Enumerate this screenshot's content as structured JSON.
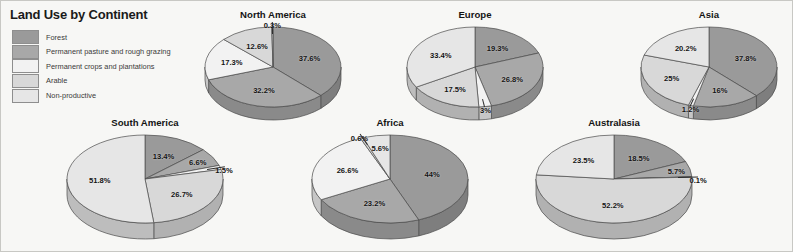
{
  "title": "Land Use by Continent",
  "legend": {
    "position": "top-left",
    "items": [
      {
        "label": "Forest",
        "color": "#9a9a9a"
      },
      {
        "label": "Permanent pasture and rough grazing",
        "color": "#a8a8a8"
      },
      {
        "label": "Permanent crops and plantations",
        "color": "#f2f2f2"
      },
      {
        "label": "Arable",
        "color": "#d8d8d8"
      },
      {
        "label": "Non-productive",
        "color": "#e6e6e6"
      }
    ]
  },
  "chart_data": {
    "type": "pie",
    "title": "Land Use by Continent",
    "xlabel": "",
    "ylabel": "",
    "units": "percent",
    "grid": false,
    "legend_position": "top-left",
    "categories": [
      "Forest",
      "Permanent pasture and rough grazing",
      "Permanent crops and plantations",
      "Arable",
      "Non-productive"
    ],
    "colors": [
      "#9a9a9a",
      "#a8a8a8",
      "#f2f2f2",
      "#d8d8d8",
      "#e6e6e6"
    ],
    "charts": [
      {
        "name": "north-america",
        "title": "North America",
        "values": [
          37.6,
          32.2,
          17.3,
          12.6,
          0.3
        ],
        "labels": [
          "37.6%",
          "32.2%",
          "17.3%",
          "12.6%",
          "0.3%"
        ]
      },
      {
        "name": "europe",
        "title": "Europe",
        "values": [
          19.3,
          26.8,
          3,
          17.5,
          33.4
        ],
        "labels": [
          "19.3%",
          "26.8%",
          "3%",
          "17.5%",
          "33.4%"
        ]
      },
      {
        "name": "asia",
        "title": "Asia",
        "values": [
          37.8,
          16,
          1.2,
          25,
          20.2
        ],
        "labels": [
          "37.8%",
          "16%",
          "1.2%",
          "25%",
          "20.2%"
        ]
      },
      {
        "name": "south-america",
        "title": "South America",
        "values": [
          13.4,
          6.6,
          1.5,
          26.7,
          51.8
        ],
        "labels": [
          "13.4%",
          "6.6%",
          "1.5%",
          "26.7%",
          "51.8%"
        ]
      },
      {
        "name": "africa",
        "title": "Africa",
        "values": [
          44,
          23.2,
          26.6,
          0.6,
          5.6
        ],
        "labels": [
          "44%",
          "23.2%",
          "26.6%",
          "0.6%",
          "5.6%"
        ]
      },
      {
        "name": "australasia",
        "title": "Australasia",
        "values": [
          18.5,
          5.7,
          0.1,
          52.2,
          23.5
        ],
        "labels": [
          "18.5%",
          "5.7%",
          "0.1%",
          "52.2%",
          "23.5%"
        ]
      }
    ]
  },
  "layout": {
    "panels": [
      {
        "name": "north-america",
        "left": 196,
        "top": 8,
        "width": 152,
        "stage_top": 16,
        "rx": 68,
        "ry": 40,
        "depth": 13,
        "start_deg": 0
      },
      {
        "name": "europe",
        "left": 398,
        "top": 8,
        "width": 152,
        "stage_top": 16,
        "rx": 68,
        "ry": 40,
        "depth": 13,
        "start_deg": 0
      },
      {
        "name": "asia",
        "left": 632,
        "top": 8,
        "width": 152,
        "stage_top": 16,
        "rx": 68,
        "ry": 40,
        "depth": 13,
        "start_deg": 0
      },
      {
        "name": "south-america",
        "left": 58,
        "top": 116,
        "width": 172,
        "stage_top": 16,
        "rx": 78,
        "ry": 44,
        "depth": 16,
        "start_deg": 0
      },
      {
        "name": "africa",
        "left": 303,
        "top": 116,
        "width": 172,
        "stage_top": 16,
        "rx": 78,
        "ry": 44,
        "depth": 16,
        "start_deg": 0
      },
      {
        "name": "australasia",
        "left": 527,
        "top": 116,
        "width": 172,
        "stage_top": 16,
        "rx": 78,
        "ry": 44,
        "depth": 16,
        "start_deg": 0
      }
    ],
    "label_radius": {
      "north-america": [
        0.58,
        0.58,
        0.62,
        0.58,
        1.12
      ],
      "europe": [
        0.58,
        0.62,
        1.02,
        0.62,
        0.58
      ],
      "asia": [
        0.58,
        0.6,
        1.02,
        0.62,
        0.58
      ],
      "south-america": [
        0.58,
        0.78,
        1.05,
        0.58,
        0.58
      ],
      "africa": [
        0.55,
        0.58,
        0.58,
        1.08,
        0.72
      ],
      "australasia": [
        0.58,
        0.82,
        1.08,
        0.58,
        0.58
      ]
    }
  }
}
